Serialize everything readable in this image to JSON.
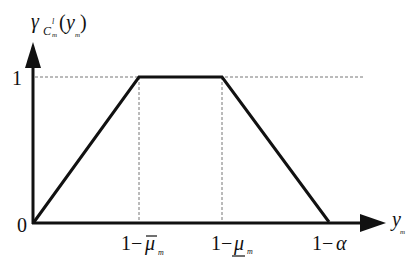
{
  "diagram": {
    "type": "trapezoidal membership function",
    "y_axis": {
      "label_main": "γ",
      "label_sub_C": "C",
      "label_sup": "l",
      "label_sub_m": "m",
      "label_open": "(",
      "label_var": "y",
      "label_var_sub": "m",
      "label_close": ")",
      "ticks": [
        "1",
        "0"
      ]
    },
    "x_axis": {
      "label": "y",
      "label_sub": "m",
      "ticks": [
        {
          "prefix": "1−",
          "symbol": "μ",
          "decoration": "overline",
          "sub": "m"
        },
        {
          "prefix": "1−",
          "symbol": "μ",
          "decoration": "underline",
          "sub": "m"
        },
        {
          "prefix": "1−",
          "symbol": "α",
          "decoration": "none",
          "sub": ""
        }
      ]
    },
    "curve_points": [
      {
        "x": "0",
        "y": 0
      },
      {
        "x": "1−μ̄_m",
        "y": 1
      },
      {
        "x": "1−μ_m",
        "y": 1
      },
      {
        "x": "1−α",
        "y": 0
      }
    ],
    "colors": {
      "line": "#111111",
      "dashed": "#777777",
      "background": "#ffffff"
    }
  }
}
